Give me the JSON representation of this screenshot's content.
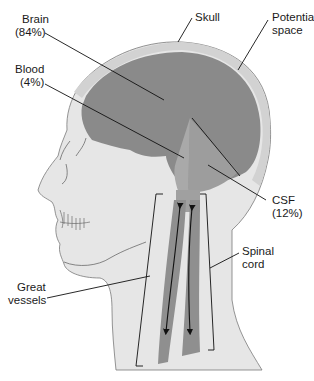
{
  "figure": {
    "labels": {
      "brain": {
        "name": "Brain",
        "value": "(84%)"
      },
      "blood": {
        "name": "Blood",
        "value": "(4%)"
      },
      "csf": {
        "name": "CSF",
        "value": "(12%)"
      },
      "skull": {
        "name": "Skull"
      },
      "potential_space": {
        "line1": "Potential",
        "line2": "space"
      },
      "spinal_cord": {
        "line1": "Spinal",
        "line2": "cord"
      },
      "great_vessels": {
        "line1": "Great",
        "line2": "vessels"
      }
    },
    "composition": [
      {
        "component": "Brain",
        "percent": 84
      },
      {
        "component": "Blood",
        "percent": 4
      },
      {
        "component": "CSF",
        "percent": 12
      }
    ],
    "colors": {
      "skin": "#e6e6e6",
      "skull": "#d2d2d2",
      "brain": "#8a8a8a",
      "csf": "#9d9d9d",
      "blood": "#a9a9a9",
      "vessel": "#8f8f8f",
      "outline": "#6a6a6a",
      "leader": "#111111"
    }
  }
}
